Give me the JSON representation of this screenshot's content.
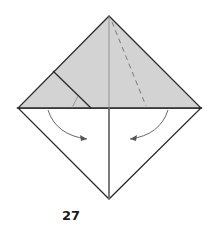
{
  "diagram": {
    "type": "origami-step",
    "step_number": "27",
    "colors": {
      "paper_colored": "#d3d3d3",
      "paper_white": "#ffffff",
      "edge": "#2b2b2b",
      "crease": "#7a7a7a",
      "arrow": "#555555"
    },
    "elements": [
      "upper colored triangle (folded flap)",
      "lower white triangle",
      "small left flap with inner edge",
      "dashed valley-fold line on right",
      "two curved fold arrows pointing toward center"
    ]
  }
}
